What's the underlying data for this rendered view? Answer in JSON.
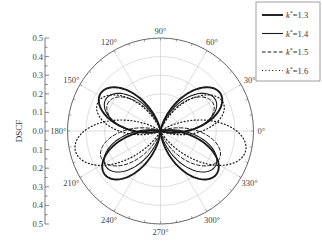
{
  "chart_data": {
    "type": "polar-line",
    "title": "",
    "ylabel": "DSCF",
    "radial_axis": {
      "range": [
        0,
        0.5
      ],
      "ticks_upper": [
        "0.5",
        "0.4",
        "0.3",
        "0.2",
        "0.1"
      ],
      "tick_center": "0.0",
      "ticks_lower": [
        "0.1",
        "0.2",
        "0.3",
        "0.4",
        "0.5"
      ],
      "grid_rings": [
        0.1,
        0.2,
        0.3,
        0.4,
        0.5
      ]
    },
    "angular_axis": {
      "unit": "degree",
      "ticks": [
        0,
        30,
        60,
        90,
        120,
        150,
        180,
        210,
        240,
        270,
        300,
        330
      ],
      "labels": [
        "0°",
        "30°",
        "60°",
        "90°",
        "120°",
        "150°",
        "180°",
        "210°",
        "240°",
        "270°",
        "300°",
        "330°"
      ]
    },
    "legend": {
      "position": "top-right",
      "entries": [
        "k*=1.3",
        "k*=1.4",
        "k*=1.5",
        "k*=1.6"
      ]
    },
    "series": [
      {
        "name": "k*=1.3",
        "style": "solid-thick",
        "lobes": [
          {
            "peak_angle": 32,
            "peak_r": 0.38
          },
          {
            "peak_angle": 148,
            "peak_r": 0.38
          },
          {
            "peak_angle": 218,
            "peak_r": 0.38
          },
          {
            "peak_angle": 322,
            "peak_r": 0.38
          }
        ]
      },
      {
        "name": "k*=1.4",
        "style": "solid",
        "lobes": [
          {
            "peak_angle": 30,
            "peak_r": 0.34
          },
          {
            "peak_angle": 150,
            "peak_r": 0.34
          },
          {
            "peak_angle": 213,
            "peak_r": 0.35
          },
          {
            "peak_angle": 327,
            "peak_r": 0.35
          }
        ]
      },
      {
        "name": "k*=1.5",
        "style": "dashed",
        "lobes": [
          {
            "peak_angle": 28,
            "peak_r": 0.32
          },
          {
            "peak_angle": 152,
            "peak_r": 0.32
          },
          {
            "peak_angle": 205,
            "peak_r": 0.35
          },
          {
            "peak_angle": 335,
            "peak_r": 0.35
          }
        ]
      },
      {
        "name": "k*=1.6",
        "style": "dotted",
        "lobes": [
          {
            "peak_angle": 24,
            "peak_r": 0.37
          },
          {
            "peak_angle": 156,
            "peak_r": 0.37
          },
          {
            "peak_angle": 193,
            "peak_r": 0.47
          },
          {
            "peak_angle": 347,
            "peak_r": 0.47
          }
        ]
      }
    ]
  }
}
